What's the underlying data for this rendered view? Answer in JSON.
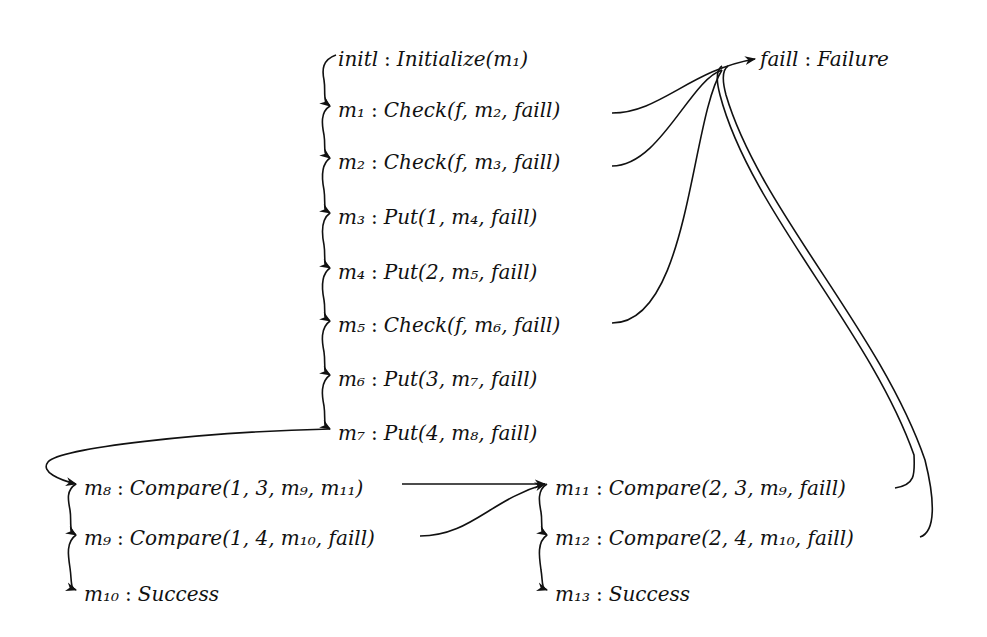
{
  "diagram": {
    "type": "control-flow / instruction graph",
    "arrow_color": "#111111",
    "nodes": [
      {
        "id": "initl",
        "label": "initl",
        "op": "Initialize(m₁)",
        "x": 330,
        "y": 47
      },
      {
        "id": "m1",
        "label": "m₁",
        "op": "Check(f, m₂, faill)",
        "x": 330,
        "y": 98
      },
      {
        "id": "m2",
        "label": "m₂",
        "op": "Check(f, m₃, faill)",
        "x": 330,
        "y": 150
      },
      {
        "id": "m3",
        "label": "m₃",
        "op": "Put(1, m₄, faill)",
        "x": 330,
        "y": 205
      },
      {
        "id": "m4",
        "label": "m₄",
        "op": "Put(2, m₅, faill)",
        "x": 330,
        "y": 260
      },
      {
        "id": "m5",
        "label": "m₅",
        "op": "Check(f, m₆, faill)",
        "x": 330,
        "y": 313
      },
      {
        "id": "m6",
        "label": "m₆",
        "op": "Put(3, m₇, faill)",
        "x": 330,
        "y": 367
      },
      {
        "id": "m7",
        "label": "m₇",
        "op": "Put(4, m₈, faill)",
        "x": 330,
        "y": 421
      },
      {
        "id": "m8",
        "label": "m₈",
        "op": "Compare(1, 3, m₉, m₁₁)",
        "x": 76,
        "y": 476
      },
      {
        "id": "m9",
        "label": "m₉",
        "op": "Compare(1, 4, m₁₀, faill)",
        "x": 76,
        "y": 526
      },
      {
        "id": "m10",
        "label": "m₁₀",
        "op": "Success",
        "x": 76,
        "y": 582
      },
      {
        "id": "m11",
        "label": "m₁₁",
        "op": "Compare(2, 3, m₉, faill)",
        "x": 547,
        "y": 476
      },
      {
        "id": "m12",
        "label": "m₁₂",
        "op": "Compare(2, 4, m₁₀, faill)",
        "x": 547,
        "y": 526
      },
      {
        "id": "m13",
        "label": "m₁₃",
        "op": "Success",
        "x": 547,
        "y": 582
      },
      {
        "id": "faill",
        "label": "faill",
        "op": "Failure",
        "x": 757,
        "y": 47
      }
    ],
    "separator": ":",
    "edges": [
      {
        "from": "initl",
        "to": "m1"
      },
      {
        "from": "m1",
        "to": "m2"
      },
      {
        "from": "m2",
        "to": "m3"
      },
      {
        "from": "m3",
        "to": "m4"
      },
      {
        "from": "m4",
        "to": "m5"
      },
      {
        "from": "m5",
        "to": "m6"
      },
      {
        "from": "m6",
        "to": "m7"
      },
      {
        "from": "m7",
        "to": "m8"
      },
      {
        "from": "m8",
        "to": "m9"
      },
      {
        "from": "m9",
        "to": "m10"
      },
      {
        "from": "m8",
        "to": "m11"
      },
      {
        "from": "m9",
        "to": "m11"
      },
      {
        "from": "m11",
        "to": "m12"
      },
      {
        "from": "m12",
        "to": "m13"
      },
      {
        "from": "m1",
        "to": "faill"
      },
      {
        "from": "m2",
        "to": "faill"
      },
      {
        "from": "m5",
        "to": "faill"
      },
      {
        "from": "m11",
        "to": "faill"
      },
      {
        "from": "m12",
        "to": "faill"
      }
    ]
  }
}
